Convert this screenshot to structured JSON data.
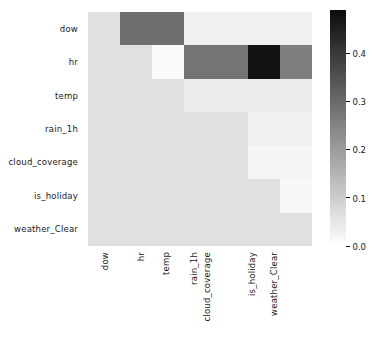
{
  "chart_data": {
    "type": "heatmap",
    "title": "",
    "xlabel": "",
    "ylabel": "",
    "grid": false,
    "mask": "lower-triangle-including-diagonal",
    "colormap": "grayscale-light-to-dark",
    "mask_color": "#e0e0e0",
    "vmin": 0.0,
    "vmax": 0.49,
    "categories": [
      "dow",
      "hr",
      "temp",
      "rain_1h",
      "cloud_coverage",
      "is_holiday",
      "weather_Clear"
    ],
    "x_tick_labels": [
      "dow",
      "hr",
      "temp",
      "rain_1h",
      "cloud_coverage",
      "is_holiday",
      "weather_Clear"
    ],
    "y_tick_labels": [
      "dow",
      "hr",
      "temp",
      "rain_1h",
      "cloud_coverage",
      "is_holiday",
      "weather_Clear"
    ],
    "rows": [
      {
        "label": "dow",
        "values": [
          null,
          0.29,
          0.29,
          0.03,
          0.03,
          0.03,
          0.03
        ]
      },
      {
        "label": "hr",
        "values": [
          null,
          null,
          0.01,
          0.28,
          0.28,
          0.48,
          0.26
        ]
      },
      {
        "label": "temp",
        "values": [
          null,
          null,
          null,
          0.04,
          0.04,
          0.04,
          0.04
        ]
      },
      {
        "label": "rain_1h",
        "values": [
          null,
          null,
          null,
          null,
          0.06,
          0.03,
          0.03
        ]
      },
      {
        "label": "cloud_coverage",
        "values": [
          null,
          null,
          null,
          null,
          null,
          0.02,
          0.02
        ]
      },
      {
        "label": "is_holiday",
        "values": [
          null,
          null,
          null,
          null,
          null,
          null,
          0.015
        ]
      },
      {
        "label": "weather_Clear",
        "values": [
          null,
          null,
          null,
          null,
          null,
          null,
          null
        ]
      }
    ],
    "colorbar": {
      "orientation": "vertical",
      "ticks": [
        0.0,
        0.1,
        0.2,
        0.3,
        0.4
      ],
      "tick_labels": [
        "0.0",
        "0.1",
        "0.2",
        "0.3",
        "0.4"
      ],
      "vmin": 0.0,
      "vmax": 0.49
    }
  }
}
